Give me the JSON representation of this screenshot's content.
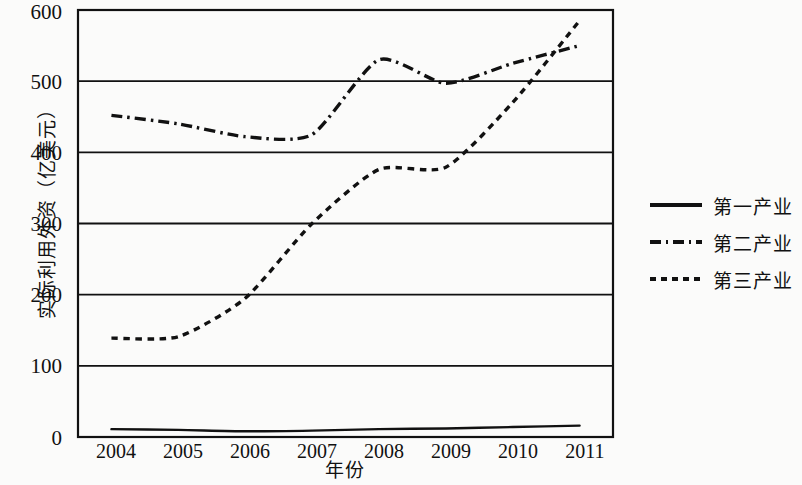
{
  "chart_data": {
    "type": "line",
    "title": "",
    "xlabel": "年份",
    "ylabel": "实际利用外资（亿美元）",
    "categories": [
      "2004",
      "2005",
      "2006",
      "2007",
      "2008",
      "2009",
      "2010",
      "2011"
    ],
    "x": [
      2004,
      2005,
      2006,
      2007,
      2008,
      2009,
      2010,
      2011
    ],
    "ylim": [
      0,
      600
    ],
    "ytick_labels": [
      "0",
      "100",
      "200",
      "300",
      "400",
      "500",
      "600"
    ],
    "ytick_values": [
      0,
      100,
      200,
      300,
      400,
      500,
      600
    ],
    "grid": "horizontal",
    "legend_position": "right",
    "series": [
      {
        "name": "第一产业",
        "style": "solid",
        "values": [
          11,
          10,
          8,
          9,
          11,
          12,
          14,
          16
        ]
      },
      {
        "name": "第二产业",
        "style": "dash-dot",
        "values": [
          452,
          440,
          422,
          425,
          530,
          497,
          525,
          550
        ]
      },
      {
        "name": "第三产业",
        "style": "dotted",
        "values": [
          139,
          141,
          195,
          300,
          376,
          379,
          470,
          585
        ]
      }
    ]
  },
  "legend": {
    "items": [
      {
        "label": "第一产业",
        "style": "solid"
      },
      {
        "label": "第二产业",
        "style": "dash-dot"
      },
      {
        "label": "第三产业",
        "style": "dotted"
      }
    ]
  },
  "axes": {
    "y_title": "实际利用外资（亿美元）",
    "x_title": "年份",
    "y_ticks": [
      "600",
      "500",
      "400",
      "300",
      "200",
      "100",
      "0"
    ],
    "x_ticks": [
      "2004",
      "2005",
      "2006",
      "2007",
      "2008",
      "2009",
      "2010",
      "2011"
    ]
  },
  "colors": {
    "line": "#111111",
    "grid": "#111111",
    "background": "#fbfbfa"
  }
}
